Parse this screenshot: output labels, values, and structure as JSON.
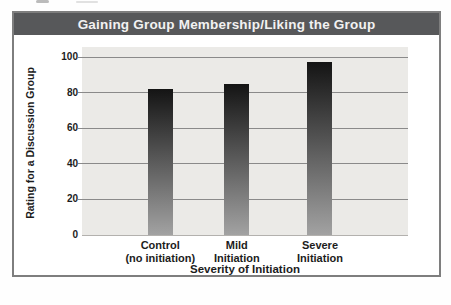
{
  "chart_data": {
    "type": "bar",
    "title": "Gaining Group Membership/Liking the Group",
    "categories": [
      "Control (no initiation)",
      "Mild Initiation",
      "Severe Initiation"
    ],
    "category_lines": [
      [
        "Control",
        "(no initiation)"
      ],
      [
        "Mild",
        "Initiation"
      ],
      [
        "Severe",
        "Initiation"
      ]
    ],
    "values": [
      82,
      85,
      97
    ],
    "xlabel": "Severity of Initiation",
    "ylabel": "Rating for a Discussion Group",
    "ylim": [
      0,
      100
    ],
    "yticks": [
      0,
      20,
      40,
      60,
      80,
      100
    ],
    "grid": true,
    "legend": false,
    "bar_color_top": "#141414",
    "bar_color_bottom": "#a2a2a2"
  },
  "colors": {
    "title_bar": "#57585a",
    "title_text": "#f2f2f2",
    "plot_bg": "#ebeae7",
    "gridline": "#8a8a8a",
    "frame_border": "#7e7e7e",
    "label_text": "#1c1c1c"
  }
}
